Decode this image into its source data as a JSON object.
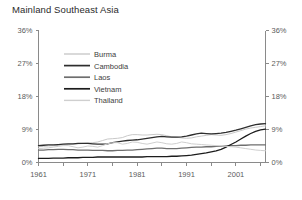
{
  "chart_data": {
    "type": "line",
    "title": "Mainland Southeast Asia",
    "xlabel": "",
    "ylabel": "",
    "xlim": [
      1961,
      2007
    ],
    "ylim": [
      0,
      36
    ],
    "grid": false,
    "legend_position": "top-left-inside",
    "y_ticks": [
      0,
      9,
      18,
      27,
      36
    ],
    "y_tick_labels": [
      "0%",
      "9%",
      "18%",
      "27%",
      "36%"
    ],
    "y_axis_duplicated_right": true,
    "x_ticks": [
      1961,
      1966,
      1971,
      1976,
      1981,
      1986,
      1991,
      1996,
      2001,
      2006
    ],
    "x_tick_labels_shown": [
      "1961",
      "1971",
      "1981",
      "1991",
      "2001"
    ],
    "x": [
      1961,
      1962,
      1963,
      1964,
      1965,
      1966,
      1967,
      1968,
      1969,
      1970,
      1971,
      1972,
      1973,
      1974,
      1975,
      1976,
      1977,
      1978,
      1979,
      1980,
      1981,
      1982,
      1983,
      1984,
      1985,
      1986,
      1987,
      1988,
      1989,
      1990,
      1991,
      1992,
      1993,
      1994,
      1995,
      1996,
      1997,
      1998,
      1999,
      2000,
      2001,
      2002,
      2003,
      2004,
      2005,
      2006,
      2007
    ],
    "series": [
      {
        "name": "Burma",
        "color": "#c9c9c9",
        "width": 1.0,
        "values": [
          4.3,
          4.4,
          4.5,
          4.6,
          4.7,
          4.8,
          4.9,
          5.0,
          5.1,
          5.2,
          5.3,
          5.4,
          5.6,
          6.0,
          6.4,
          6.5,
          6.6,
          6.8,
          7.3,
          7.6,
          7.6,
          7.5,
          7.5,
          7.6,
          7.7,
          7.6,
          7.3,
          7.0,
          6.9,
          6.7,
          6.6,
          6.7,
          7.0,
          7.2,
          7.4,
          7.6,
          7.5,
          7.4,
          7.6,
          7.9,
          8.3,
          8.7,
          9.1,
          9.4,
          9.6,
          9.8,
          10.0
        ]
      },
      {
        "name": "Cambodia",
        "color": "#2e2e2e",
        "width": 1.3,
        "values": [
          4.6,
          4.7,
          4.8,
          4.8,
          4.9,
          5.0,
          5.1,
          5.1,
          5.2,
          5.2,
          5.2,
          5.1,
          5.0,
          5.0,
          5.1,
          5.4,
          5.6,
          5.8,
          6.0,
          6.1,
          6.2,
          6.4,
          6.6,
          6.8,
          7.0,
          7.1,
          7.0,
          6.9,
          6.9,
          7.0,
          7.2,
          7.5,
          7.8,
          8.0,
          7.9,
          7.8,
          7.9,
          8.0,
          8.2,
          8.5,
          8.8,
          9.2,
          9.6,
          10.0,
          10.3,
          10.5,
          10.6
        ]
      },
      {
        "name": "Laos",
        "color": "#6e6e6e",
        "width": 1.3,
        "values": [
          3.4,
          3.4,
          3.5,
          3.5,
          3.6,
          3.6,
          3.5,
          3.5,
          3.4,
          3.4,
          3.4,
          3.3,
          3.3,
          3.3,
          3.2,
          3.2,
          3.3,
          3.3,
          3.4,
          3.4,
          3.5,
          3.6,
          3.7,
          3.8,
          3.9,
          3.9,
          3.8,
          3.8,
          3.8,
          3.9,
          4.0,
          4.1,
          4.2,
          4.2,
          4.3,
          4.3,
          4.4,
          4.4,
          4.5,
          4.6,
          4.6,
          4.7,
          4.7,
          4.8,
          4.8,
          4.8,
          4.8
        ]
      },
      {
        "name": "Vietnam",
        "color": "#1c1c1c",
        "width": 1.3,
        "values": [
          1.1,
          1.1,
          1.1,
          1.2,
          1.2,
          1.2,
          1.3,
          1.3,
          1.3,
          1.4,
          1.4,
          1.4,
          1.5,
          1.5,
          1.5,
          1.5,
          1.5,
          1.5,
          1.5,
          1.5,
          1.5,
          1.5,
          1.6,
          1.6,
          1.6,
          1.6,
          1.6,
          1.7,
          1.7,
          1.8,
          1.9,
          2.0,
          2.2,
          2.4,
          2.6,
          2.9,
          3.2,
          3.6,
          4.2,
          4.9,
          5.6,
          6.4,
          7.2,
          7.9,
          8.5,
          8.9,
          9.1
        ]
      },
      {
        "name": "Thailand",
        "color": "#cfcfcf",
        "width": 1.0,
        "values": [
          3.8,
          3.9,
          4.0,
          4.2,
          4.4,
          4.6,
          4.6,
          4.3,
          4.0,
          4.2,
          4.5,
          4.4,
          4.2,
          4.6,
          5.1,
          5.4,
          5.4,
          5.0,
          5.2,
          5.6,
          5.5,
          5.2,
          5.0,
          5.3,
          5.6,
          5.4,
          5.1,
          5.0,
          5.2,
          5.6,
          5.4,
          5.1,
          5.0,
          4.9,
          4.8,
          4.7,
          4.6,
          4.5,
          4.4,
          4.3,
          4.2,
          4.0,
          3.8,
          3.6,
          3.4,
          3.3,
          3.2
        ]
      }
    ]
  },
  "legend": {
    "items": [
      {
        "label": "Burma"
      },
      {
        "label": "Cambodia"
      },
      {
        "label": "Laos"
      },
      {
        "label": "Vietnam"
      },
      {
        "label": "Thailand"
      }
    ]
  }
}
